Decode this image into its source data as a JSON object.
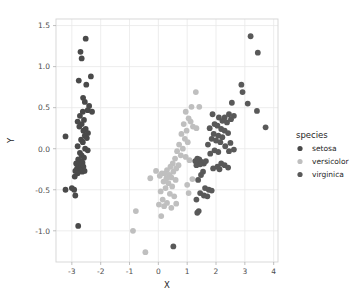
{
  "chart_data": {
    "type": "scatter",
    "title": "",
    "xlabel": "X",
    "ylabel": "Y",
    "xlim": [
      -3.55,
      4.15
    ],
    "ylim": [
      -1.38,
      1.58
    ],
    "xticks": [
      -3,
      -2,
      -1,
      0,
      1,
      2,
      3,
      4
    ],
    "yticks": [
      -1.0,
      -0.5,
      0.0,
      0.5,
      1.0,
      1.5
    ],
    "xticklabels": [
      "-3",
      "-2",
      "-1",
      "0",
      "1",
      "2",
      "3",
      "4"
    ],
    "yticklabels": [
      "-1.0",
      "-0.5",
      "0.0",
      "0.5",
      "1.0",
      "1.5"
    ],
    "grid": true,
    "legend": {
      "title": "species",
      "position": "right",
      "entries": [
        {
          "name": "setosa",
          "color": "#4a4a4a"
        },
        {
          "name": "versicolor",
          "color": "#bfbfbf"
        },
        {
          "name": "virginica",
          "color": "#595959"
        }
      ]
    },
    "marker_size": 4.2,
    "series": [
      {
        "name": "setosa",
        "color": "#4a4a4a",
        "points": [
          [
            -2.52,
            1.34
          ],
          [
            -2.7,
            1.18
          ],
          [
            -2.66,
            1.1
          ],
          [
            -2.76,
            0.83
          ],
          [
            -2.34,
            0.88
          ],
          [
            -2.5,
            0.78
          ],
          [
            -2.61,
            0.62
          ],
          [
            -2.55,
            0.57
          ],
          [
            -2.4,
            0.52
          ],
          [
            -2.45,
            0.47
          ],
          [
            -2.3,
            0.45
          ],
          [
            -2.62,
            0.45
          ],
          [
            -2.72,
            0.4
          ],
          [
            -2.58,
            0.35
          ],
          [
            -2.8,
            0.33
          ],
          [
            -2.66,
            0.3
          ],
          [
            -2.74,
            0.27
          ],
          [
            -2.52,
            0.24
          ],
          [
            -2.6,
            0.22
          ],
          [
            -2.44,
            0.19
          ],
          [
            -3.22,
            0.15
          ],
          [
            -2.55,
            0.16
          ],
          [
            -2.48,
            0.13
          ],
          [
            -2.68,
            0.11
          ],
          [
            -2.62,
            0.08
          ],
          [
            -2.8,
            0.03
          ],
          [
            -2.54,
            0.0
          ],
          [
            -2.45,
            -0.02
          ],
          [
            -2.72,
            -0.05
          ],
          [
            -2.66,
            -0.08
          ],
          [
            -2.58,
            -0.11
          ],
          [
            -2.78,
            -0.13
          ],
          [
            -2.7,
            -0.15
          ],
          [
            -2.63,
            -0.17
          ],
          [
            -2.85,
            -0.18
          ],
          [
            -2.74,
            -0.2
          ],
          [
            -2.68,
            -0.21
          ],
          [
            -2.6,
            -0.22
          ],
          [
            -2.82,
            -0.24
          ],
          [
            -2.76,
            -0.25
          ],
          [
            -2.7,
            -0.26
          ],
          [
            -2.88,
            -0.27
          ],
          [
            -2.64,
            -0.28
          ],
          [
            -2.56,
            -0.27
          ],
          [
            -2.8,
            -0.3
          ],
          [
            -2.9,
            -0.34
          ],
          [
            -3.22,
            -0.5
          ],
          [
            -3.0,
            -0.48
          ],
          [
            -2.92,
            -0.5
          ],
          [
            -2.88,
            -0.57
          ],
          [
            -2.78,
            -0.94
          ]
        ]
      },
      {
        "name": "versicolor",
        "color": "#bfbfbf",
        "points": [
          [
            1.3,
            0.69
          ],
          [
            1.15,
            0.51
          ],
          [
            1.42,
            0.51
          ],
          [
            0.95,
            0.45
          ],
          [
            1.05,
            0.37
          ],
          [
            1.12,
            0.33
          ],
          [
            0.88,
            0.3
          ],
          [
            1.2,
            0.27
          ],
          [
            0.98,
            0.22
          ],
          [
            1.32,
            0.25
          ],
          [
            0.8,
            0.18
          ],
          [
            0.92,
            0.12
          ],
          [
            1.02,
            0.08
          ],
          [
            0.72,
            0.05
          ],
          [
            0.85,
            0.0
          ],
          [
            0.65,
            -0.03
          ],
          [
            0.78,
            -0.08
          ],
          [
            0.58,
            -0.12
          ],
          [
            0.95,
            -0.1
          ],
          [
            1.08,
            -0.14
          ],
          [
            0.5,
            -0.18
          ],
          [
            0.7,
            -0.2
          ],
          [
            0.42,
            -0.22
          ],
          [
            0.62,
            -0.24
          ],
          [
            0.3,
            -0.26
          ],
          [
            0.52,
            -0.28
          ],
          [
            0.22,
            -0.3
          ],
          [
            0.38,
            -0.32
          ],
          [
            -0.08,
            -0.27
          ],
          [
            0.12,
            -0.3
          ],
          [
            0.05,
            -0.33
          ],
          [
            0.45,
            -0.35
          ],
          [
            0.28,
            -0.36
          ],
          [
            0.6,
            -0.38
          ],
          [
            -0.28,
            -0.36
          ],
          [
            1.18,
            -0.37
          ],
          [
            0.18,
            -0.4
          ],
          [
            0.35,
            -0.42
          ],
          [
            1.0,
            -0.44
          ],
          [
            0.48,
            -0.46
          ],
          [
            0.25,
            -0.48
          ],
          [
            0.08,
            -0.52
          ],
          [
            1.05,
            -0.54
          ],
          [
            0.4,
            -0.55
          ],
          [
            0.55,
            -0.58
          ],
          [
            0.15,
            -0.62
          ],
          [
            0.3,
            -0.66
          ],
          [
            0.62,
            -0.67
          ],
          [
            0.02,
            -0.68
          ],
          [
            0.2,
            -0.7
          ],
          [
            0.45,
            -0.72
          ],
          [
            -0.78,
            -0.76
          ],
          [
            0.1,
            -0.82
          ],
          [
            -0.88,
            -1.0
          ],
          [
            -0.45,
            -1.26
          ]
        ]
      },
      {
        "name": "virginica",
        "color": "#595959",
        "points": [
          [
            3.2,
            1.37
          ],
          [
            3.45,
            1.17
          ],
          [
            2.88,
            0.78
          ],
          [
            2.92,
            0.69
          ],
          [
            2.55,
            0.56
          ],
          [
            3.1,
            0.55
          ],
          [
            3.42,
            0.46
          ],
          [
            2.45,
            0.42
          ],
          [
            2.62,
            0.4
          ],
          [
            2.3,
            0.38
          ],
          [
            2.52,
            0.36
          ],
          [
            1.88,
            0.42
          ],
          [
            2.1,
            0.38
          ],
          [
            2.22,
            0.34
          ],
          [
            2.38,
            0.32
          ],
          [
            1.95,
            0.3
          ],
          [
            2.05,
            0.28
          ],
          [
            3.72,
            0.26
          ],
          [
            1.78,
            0.25
          ],
          [
            2.18,
            0.24
          ],
          [
            2.3,
            0.22
          ],
          [
            1.92,
            0.18
          ],
          [
            2.42,
            0.19
          ],
          [
            2.08,
            0.16
          ],
          [
            2.22,
            0.14
          ],
          [
            1.85,
            0.12
          ],
          [
            2.0,
            0.1
          ],
          [
            2.15,
            0.08
          ],
          [
            2.5,
            0.07
          ],
          [
            1.72,
            0.05
          ],
          [
            2.32,
            0.03
          ],
          [
            2.62,
            -0.01
          ],
          [
            1.95,
            -0.02
          ],
          [
            2.08,
            -0.04
          ],
          [
            2.45,
            -0.03
          ],
          [
            1.8,
            -0.06
          ],
          [
            1.35,
            -0.12
          ],
          [
            1.42,
            -0.13
          ],
          [
            1.28,
            -0.15
          ],
          [
            1.5,
            -0.16
          ],
          [
            1.38,
            -0.17
          ],
          [
            1.58,
            -0.18
          ],
          [
            1.45,
            -0.19
          ],
          [
            1.32,
            -0.2
          ],
          [
            1.65,
            -0.15
          ],
          [
            2.18,
            -0.18
          ],
          [
            2.3,
            -0.2
          ],
          [
            2.05,
            -0.22
          ],
          [
            2.42,
            -0.23
          ],
          [
            1.9,
            -0.24
          ],
          [
            2.12,
            -0.25
          ],
          [
            1.55,
            -0.28
          ],
          [
            1.48,
            -0.32
          ],
          [
            1.38,
            -0.38
          ],
          [
            1.62,
            -0.48
          ],
          [
            1.75,
            -0.5
          ],
          [
            1.85,
            -0.51
          ],
          [
            1.45,
            -0.54
          ],
          [
            1.58,
            -0.57
          ],
          [
            1.7,
            -0.58
          ],
          [
            1.32,
            -0.62
          ],
          [
            1.4,
            -0.76
          ],
          [
            1.35,
            -0.78
          ],
          [
            0.52,
            -1.19
          ]
        ]
      }
    ]
  }
}
